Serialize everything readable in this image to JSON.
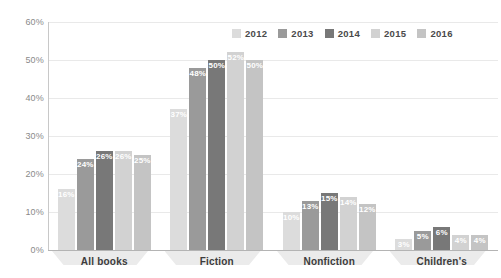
{
  "chart_data": {
    "type": "bar",
    "title": "",
    "subtitle": "",
    "xlabel": "",
    "ylabel": "",
    "ylim": [
      0,
      60
    ],
    "ytick_labels": [
      "60%",
      "50%",
      "40%",
      "30%",
      "20%",
      "10%",
      "0%"
    ],
    "ytick_values": [
      60,
      50,
      40,
      30,
      20,
      10,
      0
    ],
    "grid": true,
    "legend_position": "top-right",
    "categories": [
      "All books",
      "Fiction",
      "Nonfiction",
      "Children's"
    ],
    "series": [
      {
        "name": "2012",
        "color": "#dcdcdc",
        "values": [
          16,
          37,
          10,
          3
        ],
        "labels": [
          "16%",
          "37%",
          "10%",
          "3%"
        ]
      },
      {
        "name": "2013",
        "color": "#9a9a9a",
        "values": [
          24,
          48,
          13,
          5
        ],
        "labels": [
          "24%",
          "48%",
          "13%",
          "5%"
        ]
      },
      {
        "name": "2014",
        "color": "#787878",
        "values": [
          26,
          50,
          15,
          6
        ],
        "labels": [
          "26%",
          "50%",
          "15%",
          "6%"
        ]
      },
      {
        "name": "2015",
        "color": "#d2d2d2",
        "values": [
          26,
          52,
          14,
          4
        ],
        "labels": [
          "26%",
          "52%",
          "14%",
          "4%"
        ]
      },
      {
        "name": "2016",
        "color": "#c4c4c4",
        "values": [
          25,
          50,
          12,
          4
        ],
        "labels": [
          "25%",
          "50%",
          "12%",
          "4%"
        ]
      }
    ]
  },
  "colors": {
    "background": "#ffffff",
    "gridline": "#e9e9e9",
    "axis": "#c8c8c8",
    "axis_x": "#b4b4b4",
    "tick_text": "#8a8a8a",
    "category_text": "#3c3c3c",
    "legend_text": "#4a4a4a",
    "value_text": "#ffffff",
    "category_shadow": "#ebebeb"
  }
}
